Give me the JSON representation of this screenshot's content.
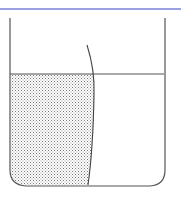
{
  "diagram": {
    "type": "container-with-liquid",
    "colors": {
      "top_rule": "#9aa0e0",
      "outline": "#555555",
      "stipple": "#8a8a8a",
      "background": "#ffffff"
    },
    "elements": [
      "top-rule",
      "container-outline",
      "liquid-surface-line",
      "curved-boundary",
      "stippled-region"
    ]
  }
}
